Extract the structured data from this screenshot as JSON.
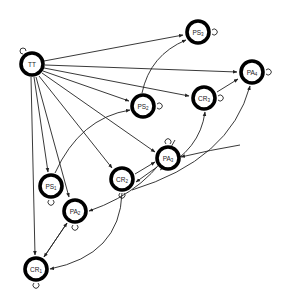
{
  "diagram": {
    "type": "directed-graph",
    "nodes": [
      {
        "id": "TT",
        "label": "TT",
        "x": 32,
        "y": 64,
        "loop": "top-left"
      },
      {
        "id": "PS3",
        "label": "PS3",
        "x": 198,
        "y": 32,
        "loop": "right"
      },
      {
        "id": "PA4",
        "label": "PA4",
        "x": 252,
        "y": 72,
        "loop": "right"
      },
      {
        "id": "CR3",
        "label": "CR3",
        "x": 204,
        "y": 98,
        "loop": "right"
      },
      {
        "id": "PS2",
        "label": "PS2",
        "x": 143,
        "y": 106,
        "loop": "right"
      },
      {
        "id": "PA3",
        "label": "PA3",
        "x": 168,
        "y": 158,
        "loop": "top"
      },
      {
        "id": "CR2",
        "label": "CR2",
        "x": 122,
        "y": 179,
        "loop": "bottom"
      },
      {
        "id": "PS1",
        "label": "PS1",
        "x": 51,
        "y": 186,
        "loop": "bottom"
      },
      {
        "id": "PA2",
        "label": "PA2",
        "x": 75,
        "y": 211,
        "loop": "bottom"
      },
      {
        "id": "CR1",
        "label": "CR1",
        "x": 36,
        "y": 269,
        "loop": "bottom"
      }
    ],
    "edges": [
      {
        "from": "TT",
        "to": "PS3",
        "d": "M44 61 L183 35"
      },
      {
        "from": "TT",
        "to": "PA4",
        "d": "M45 65 L237 72"
      },
      {
        "from": "TT",
        "to": "CR3",
        "d": "M44 68 L189 96"
      },
      {
        "from": "TT",
        "to": "PS2",
        "d": "M43 71 L129 101"
      },
      {
        "from": "TT",
        "to": "PA3",
        "d": "M42 73 L155 152"
      },
      {
        "from": "TT",
        "to": "CR2",
        "d": "M39 76 L112 168"
      },
      {
        "from": "TT",
        "to": "PA2",
        "d": "M36 77 L69 197"
      },
      {
        "from": "TT",
        "to": "PS1",
        "d": "M34 77 L48 172"
      },
      {
        "from": "TT",
        "to": "CR1",
        "d": "M31 77 L35 255"
      },
      {
        "from": "PS1",
        "to": "PS2",
        "d": "M55 173 Q80 118 130 110"
      },
      {
        "from": "PS2",
        "to": "PS3",
        "d": "M142 93 Q150 55 186 40"
      },
      {
        "from": "CR3",
        "to": "PA4",
        "d": "M217 92 L238 79"
      },
      {
        "from": "CR2",
        "to": "PA3",
        "d": "M135 174 L155 162"
      },
      {
        "from": "PA3",
        "to": "CR2",
        "d": "M157 167 L136 182"
      },
      {
        "from": "PA3",
        "to": "CR3",
        "d": "M160 170 Q200 150 205 112"
      },
      {
        "from": "CR2",
        "to": "PA4",
        "d": "M132 190 Q230 160 250 86"
      },
      {
        "from": "PA4",
        "to": "PA3",
        "d": "M240 145 Q210 150 181 157"
      },
      {
        "from": "PA3",
        "to": "PA2",
        "d": "M175 140 Q150 190 89 211"
      },
      {
        "from": "CR2",
        "to": "CR1",
        "d": "M122 193 Q120 255 50 269"
      },
      {
        "from": "CR1",
        "to": "PA2",
        "d": "M44 257 L67 223"
      },
      {
        "from": "PA2",
        "to": "CR1",
        "d": "M67 223 L44 257"
      }
    ]
  }
}
